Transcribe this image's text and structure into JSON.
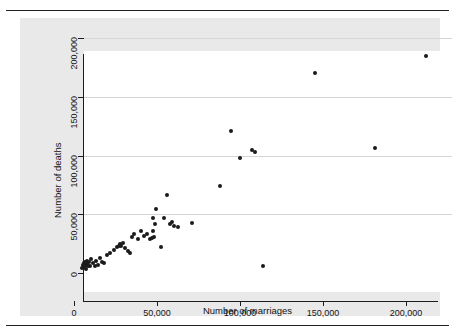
{
  "chart_data": {
    "type": "scatter",
    "title": "",
    "xlabel": "Number of marriages",
    "ylabel": "Number of deaths",
    "xlim": [
      0,
      215000
    ],
    "ylim": [
      0,
      205000
    ],
    "xticks": [
      0,
      50000,
      100000,
      150000,
      200000
    ],
    "yticks": [
      0,
      50000,
      100000,
      150000,
      200000
    ],
    "xtick_labels": [
      "0",
      "50,000",
      "100,000",
      "150,000",
      "200,000"
    ],
    "ytick_labels": [
      "0",
      "50,000",
      "100,000",
      "150,000",
      "200,000"
    ],
    "grid": "horizontal",
    "legend": null,
    "marker_color": "#1b1b1b",
    "panel_color": "#e9e9e9",
    "plot_bg_color": "#ffffff",
    "gridline_color": "#d6d6d6",
    "points": [
      [
        4800,
        4300
      ],
      [
        5400,
        6400
      ],
      [
        6000,
        8100
      ],
      [
        6300,
        5100
      ],
      [
        6600,
        9400
      ],
      [
        7000,
        6800
      ],
      [
        7200,
        3800
      ],
      [
        7600,
        10200
      ],
      [
        8000,
        7700
      ],
      [
        8400,
        5600
      ],
      [
        9000,
        9000
      ],
      [
        9600,
        6000
      ],
      [
        10500,
        11500
      ],
      [
        11400,
        8500
      ],
      [
        12600,
        5600
      ],
      [
        13200,
        9800
      ],
      [
        14400,
        7200
      ],
      [
        15600,
        12800
      ],
      [
        16800,
        9400
      ],
      [
        18000,
        8100
      ],
      [
        19800,
        14900
      ],
      [
        21600,
        17000
      ],
      [
        24000,
        19600
      ],
      [
        25800,
        22100
      ],
      [
        27000,
        23400
      ],
      [
        27600,
        24700
      ],
      [
        28200,
        23000
      ],
      [
        29400,
        25200
      ],
      [
        30600,
        21300
      ],
      [
        32400,
        19100
      ],
      [
        33600,
        17000
      ],
      [
        34800,
        30600
      ],
      [
        36000,
        33600
      ],
      [
        38400,
        28900
      ],
      [
        40200,
        36100
      ],
      [
        42000,
        31900
      ],
      [
        43800,
        33600
      ],
      [
        45600,
        28900
      ],
      [
        46800,
        30200
      ],
      [
        47400,
        47200
      ],
      [
        47400,
        36100
      ],
      [
        48000,
        31000
      ],
      [
        48600,
        41300
      ],
      [
        49200,
        54400
      ],
      [
        52200,
        22100
      ],
      [
        54000,
        47200
      ],
      [
        55800,
        66000
      ],
      [
        57600,
        41300
      ],
      [
        58800,
        43000
      ],
      [
        60000,
        40400
      ],
      [
        62400,
        39100
      ],
      [
        70800,
        42500
      ],
      [
        88200,
        74000
      ],
      [
        94800,
        120900
      ],
      [
        100200,
        98200
      ],
      [
        107400,
        104600
      ],
      [
        109200,
        103000
      ],
      [
        114000,
        6000
      ],
      [
        145200,
        170600
      ],
      [
        181200,
        106300
      ],
      [
        211800,
        184300
      ]
    ]
  },
  "axes": {
    "y_title": "Number of deaths",
    "x_title": "Number of marriages"
  }
}
